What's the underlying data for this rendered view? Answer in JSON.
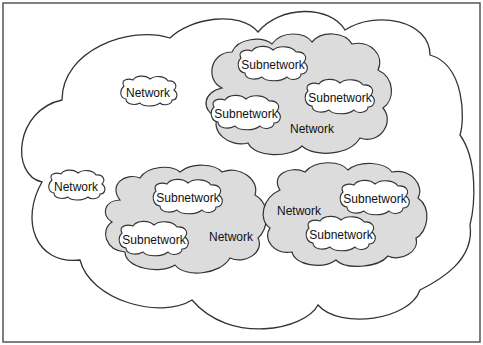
{
  "diagram": {
    "colors": {
      "frame": "#555555",
      "outline": "#333333",
      "shaded_fill": "#dcdcdc",
      "white_fill": "#ffffff",
      "text": "#111111"
    },
    "outer_cloud": {
      "label": ""
    },
    "standalone_networks": [
      {
        "id": "net-a",
        "label": "Network",
        "x": 148,
        "y": 93
      },
      {
        "id": "net-b",
        "label": "Network",
        "x": 76,
        "y": 187
      }
    ],
    "shaded_networks": [
      {
        "id": "net-top",
        "label": "Network",
        "label_pos": {
          "x": 312,
          "y": 129
        },
        "subnetworks": [
          {
            "label": "Subnetwork",
            "x": 273,
            "y": 65
          },
          {
            "label": "Subnetwork",
            "x": 340,
            "y": 98
          },
          {
            "label": "Subnetwork",
            "x": 246,
            "y": 114
          }
        ]
      },
      {
        "id": "net-bottom-left",
        "label": "Network",
        "label_pos": {
          "x": 231,
          "y": 237
        },
        "subnetworks": [
          {
            "label": "Subnetwork",
            "x": 188,
            "y": 198
          },
          {
            "label": "Subnetwork",
            "x": 154,
            "y": 240
          }
        ]
      },
      {
        "id": "net-bottom-right",
        "label": "Network",
        "label_pos": {
          "x": 299,
          "y": 211
        },
        "subnetworks": [
          {
            "label": "Subnetwork",
            "x": 375,
            "y": 199
          },
          {
            "label": "Subnetwork",
            "x": 341,
            "y": 235
          }
        ]
      }
    ]
  }
}
